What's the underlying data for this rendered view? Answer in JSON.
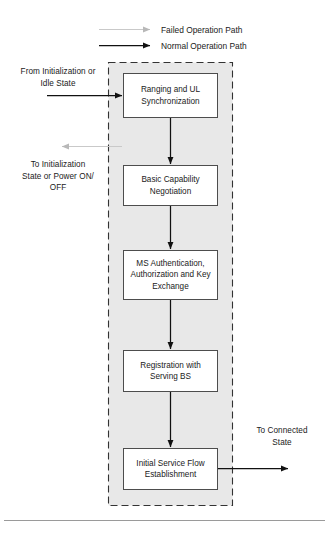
{
  "diagram": {
    "type": "flowchart",
    "legend": {
      "items": [
        {
          "label": "Failed Operation Path",
          "style": "gray-thin-arrow",
          "color": "#b8b8b8"
        },
        {
          "label": "Normal Operation Path",
          "style": "black-solid-arrow",
          "color": "#111111"
        }
      ]
    },
    "container": {
      "name": "network-entry-group",
      "border_style": "dashed",
      "fill": "#e8e8e8"
    },
    "external_labels": {
      "entry": "From Initialization or\nIdle State",
      "entry_lines": [
        "From Initialization or",
        "Idle State"
      ],
      "failure_exit_lines": [
        "To Initialization",
        "State or Power ON/",
        "OFF"
      ],
      "success_exit_lines": [
        "To Connected",
        "State"
      ]
    },
    "nodes": [
      {
        "id": "ranging",
        "lines": [
          "Ranging and UL",
          "Synchronization"
        ]
      },
      {
        "id": "basic-cap",
        "lines": [
          "Basic Capability",
          "Negotiation"
        ]
      },
      {
        "id": "ms-auth",
        "lines": [
          "MS Authentication,",
          "Authorization and Key",
          "Exchange"
        ]
      },
      {
        "id": "registration",
        "lines": [
          "Registration with",
          "Serving BS"
        ]
      },
      {
        "id": "initial-flow",
        "lines": [
          "Initial Service Flow",
          "Establishment"
        ]
      }
    ],
    "colors": {
      "box_stroke": "#4d4d4d",
      "box_fill": "#ffffff",
      "group_fill": "#e8e8e8",
      "group_stroke": "#333333",
      "normal_path": "#111111",
      "failed_path": "#b8b8b8",
      "page_rule": "#9a9a9a"
    }
  }
}
